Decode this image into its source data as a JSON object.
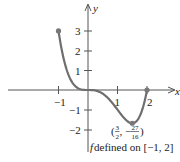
{
  "chart_data": {
    "type": "line",
    "title": "",
    "function": "f(x) = x^4 - 2x^3",
    "domain": [
      -1,
      2
    ],
    "xlabel": "x",
    "ylabel": "y",
    "x_ticks": [
      "-1",
      "1",
      "2"
    ],
    "y_ticks": [
      "3",
      "2",
      "1",
      "-1",
      "-2"
    ],
    "xlim": [
      -3,
      3
    ],
    "ylim": [
      -2.5,
      3.5
    ],
    "grid": false,
    "points": [
      {
        "x": -1,
        "y": 3,
        "label": ""
      },
      {
        "x": 1.5,
        "y": -1.6875,
        "label": "(3/2, -27/16)"
      },
      {
        "x": 2,
        "y": 0,
        "label": ""
      }
    ],
    "annotation": "f defined on [-1, 2]",
    "curve_color": "#6e6e6e"
  },
  "labels": {
    "x_axis": "x",
    "y_axis": "y",
    "min_point_open": "(",
    "min_x_num": "3",
    "min_x_den": "2",
    "min_sep": ", −",
    "min_y_num": "27",
    "min_y_den": "16",
    "min_point_close": ")",
    "f_label": "f",
    "domain_text": " defined on [−1, 2]",
    "tick_x_neg1": "−1",
    "tick_x_1": "1",
    "tick_x_2": "2",
    "tick_y_3": "3",
    "tick_y_2": "2",
    "tick_y_1": "1",
    "tick_y_neg1": "−1",
    "tick_y_neg2": "−2"
  }
}
